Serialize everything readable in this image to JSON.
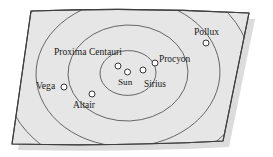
{
  "diagram": {
    "type": "concentric-distance-rings",
    "background_color": "#ffffff",
    "plane_fill": "#e4e4e4",
    "plane_stroke": "#4a4a4a",
    "ring_stroke": "#555555",
    "shadow_color": "#d9d9d9",
    "star_fill": "#ffffff",
    "star_stroke": "#222222",
    "plane_corners": [
      {
        "x": 31,
        "y": 11
      },
      {
        "x": 249,
        "y": 13
      },
      {
        "x": 223,
        "y": 141
      },
      {
        "x": 12,
        "y": 144
      }
    ],
    "shadow_offset": {
      "dx": 6,
      "dy": 6
    },
    "rings": {
      "center": {
        "x": 128,
        "y": 73
      },
      "radii": [
        28,
        60,
        92,
        124,
        156
      ],
      "count": 5
    },
    "stars": [
      {
        "name": "Sun",
        "label": "Sun",
        "dot": {
          "x": 127.5,
          "y": 72.0
        },
        "label_pos": {
          "x": 118,
          "y": 78
        },
        "font_size": 9.2
      },
      {
        "name": "ProximaCentauri",
        "label": "Proxima Centauri",
        "dot": {
          "x": 118.0,
          "y": 66.0
        },
        "label_pos": {
          "x": 54,
          "y": 47
        },
        "font_size": 9.6
      },
      {
        "name": "Sirius",
        "label": "Sirius",
        "dot": {
          "x": 143.0,
          "y": 70.0
        },
        "label_pos": {
          "x": 144,
          "y": 80
        },
        "font_size": 9.4
      },
      {
        "name": "Procyon",
        "label": "Procyon",
        "dot": {
          "x": 155.0,
          "y": 63.0
        },
        "label_pos": {
          "x": 159,
          "y": 55
        },
        "font_size": 9.4
      },
      {
        "name": "Pollux",
        "label": "Pollux",
        "dot": {
          "x": 206.0,
          "y": 43.0
        },
        "label_pos": {
          "x": 194,
          "y": 27
        },
        "font_size": 9.6
      },
      {
        "name": "Vega",
        "label": "Vega",
        "dot": {
          "x": 64.0,
          "y": 87.0
        },
        "label_pos": {
          "x": 36,
          "y": 81
        },
        "font_size": 9.6
      },
      {
        "name": "Altair",
        "label": "Altair",
        "dot": {
          "x": 92.0,
          "y": 94.0
        },
        "label_pos": {
          "x": 73,
          "y": 101
        },
        "font_size": 9.4
      }
    ],
    "star_dot_radius": 3.0
  }
}
